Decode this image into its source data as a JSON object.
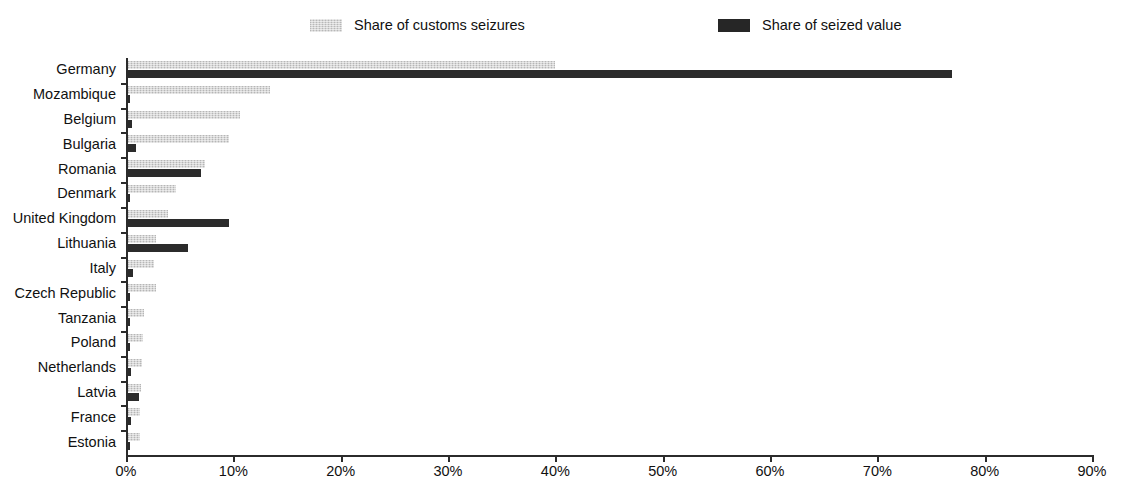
{
  "chart_data": {
    "type": "bar",
    "orientation": "horizontal",
    "title": "",
    "subtitle": "",
    "xlabel": "",
    "ylabel": "",
    "xlim": [
      0,
      90
    ],
    "xtick_labels": [
      "0%",
      "10%",
      "20%",
      "30%",
      "40%",
      "50%",
      "60%",
      "70%",
      "80%",
      "90%"
    ],
    "xtick_values": [
      0,
      10,
      20,
      30,
      40,
      50,
      60,
      70,
      80,
      90
    ],
    "grid": false,
    "legend_position": "top",
    "categories": [
      "Germany",
      "Mozambique",
      "Belgium",
      "Bulgaria",
      "Romania",
      "Denmark",
      "United Kingdom",
      "Lithuania",
      "Italy",
      "Czech Republic",
      "Tanzania",
      "Poland",
      "Netherlands",
      "Latvia",
      "France",
      "Estonia"
    ],
    "series": [
      {
        "name": "Share of customs seizures",
        "color": "#d6d6d6",
        "values": [
          39.8,
          13.2,
          10.4,
          9.4,
          7.2,
          4.5,
          3.7,
          2.6,
          2.4,
          2.6,
          1.5,
          1.4,
          1.3,
          1.2,
          1.1,
          1.1
        ]
      },
      {
        "name": "Share of seized value",
        "color": "#2b2b2b",
        "values": [
          76.8,
          0.2,
          0.4,
          0.7,
          6.8,
          0.2,
          9.4,
          5.6,
          0.5,
          0.2,
          0.2,
          0.2,
          0.3,
          1.0,
          0.3,
          0.2
        ]
      }
    ]
  },
  "legend": {
    "items": [
      {
        "label": "Share of customs seizures",
        "swatch": "light"
      },
      {
        "label": "Share of seized value",
        "swatch": "dark"
      }
    ]
  }
}
